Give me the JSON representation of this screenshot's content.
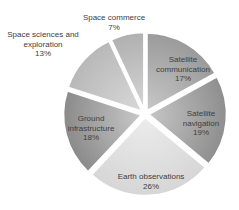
{
  "chart_data": {
    "type": "pie",
    "title": "",
    "legend": "none (data labels on slices)",
    "start_angle_deg": 0,
    "direction": "clockwise",
    "slices": [
      {
        "label": "Satellite communication",
        "value": 17,
        "value_label": "17%",
        "color": "#9a9a9a",
        "color_light": "#c8c8c8"
      },
      {
        "label": "Satellite navigation",
        "value": 19,
        "value_label": "19%",
        "color": "#8e8e8e",
        "color_light": "#c6c6c6"
      },
      {
        "label": "Earth observations",
        "value": 26,
        "value_label": "26%",
        "color": "#d6d6d6",
        "color_light": "#ececec"
      },
      {
        "label": "Ground infrastructure",
        "value": 18,
        "value_label": "18%",
        "color": "#8a8a8a",
        "color_light": "#c9c9c9"
      },
      {
        "label": "Space sciences and exploration",
        "value": 13,
        "value_label": "13%",
        "color": "#b8b8b8",
        "color_light": "#d9d9d9"
      },
      {
        "label": "Space commerce",
        "value": 7,
        "value_label": "7%",
        "color": "#b0b0b0",
        "color_light": "#d6d6d6"
      }
    ]
  },
  "labels": {
    "sat_comm": {
      "line1": "Satellite",
      "line2": "communication",
      "pct": "17%"
    },
    "sat_nav": {
      "line1": "Satellite",
      "line2": "navigation",
      "pct": "19%"
    },
    "earth_obs": {
      "line1": "Earth observations",
      "pct": "26%"
    },
    "ground": {
      "line1": "Ground",
      "line2": "infrastructure",
      "pct": "18%"
    },
    "space_sci": {
      "line1": "Space sciences and",
      "line2": "exploration",
      "pct": "13%"
    },
    "space_com": {
      "line1": "Space commerce",
      "pct": "7%"
    }
  }
}
